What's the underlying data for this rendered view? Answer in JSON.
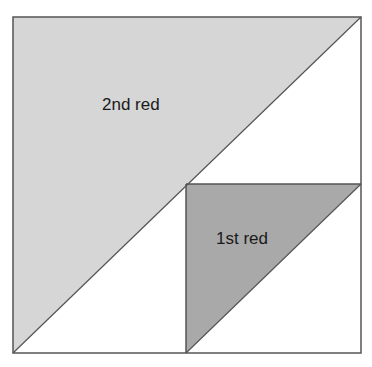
{
  "diagram": {
    "labels": {
      "second": "2nd red",
      "first": "1st red"
    },
    "colors": {
      "background": "#ffffff",
      "second_fill": "#d6d6d6",
      "first_fill": "#a9a9a9",
      "stroke": "#555555"
    }
  }
}
